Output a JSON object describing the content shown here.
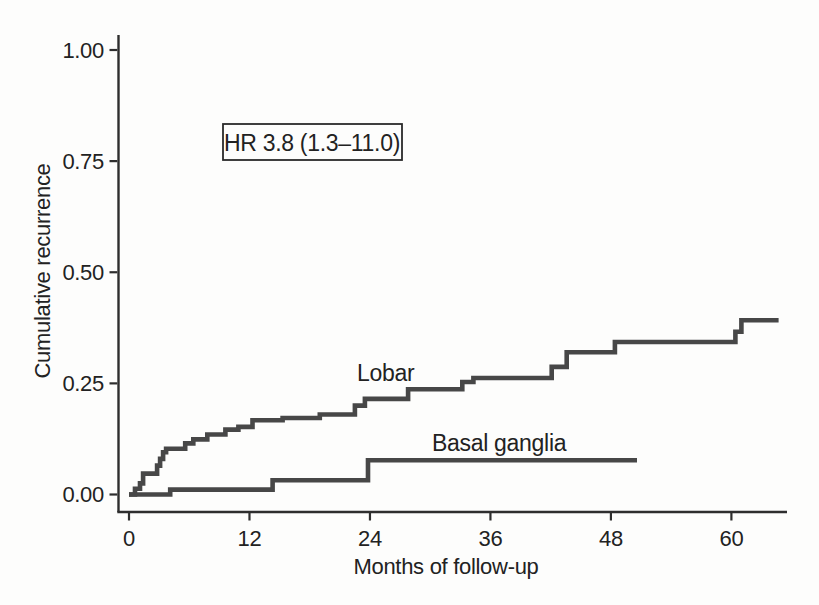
{
  "chart_data": {
    "type": "line",
    "subtype": "kaplan-meier-step",
    "title": "",
    "xlabel": "Months of follow-up",
    "ylabel": "Cumulative recurrence",
    "xlim": [
      0,
      65.5
    ],
    "ylim": [
      0,
      1.0
    ],
    "grid": false,
    "legend_position": "inline-labels",
    "line_color": "#474747",
    "x_ticks": {
      "values": [
        0,
        12,
        24,
        36,
        48,
        60
      ],
      "labels": [
        "0",
        "12",
        "24",
        "36",
        "48",
        "60"
      ]
    },
    "y_ticks": {
      "values": [
        0,
        0.25,
        0.5,
        0.75,
        1.0
      ],
      "labels": [
        "0.00",
        "0.25",
        "0.50",
        "0.75",
        "1.00"
      ]
    },
    "annotation": {
      "text": "HR 3.8 (1.3–11.0)"
    },
    "series": [
      {
        "name": "Lobar",
        "label": "Lobar",
        "end_x": 64.7,
        "points": [
          [
            0,
            0
          ],
          [
            0.6,
            0.013
          ],
          [
            1.1,
            0.025
          ],
          [
            1.4,
            0.047
          ],
          [
            2.8,
            0.065
          ],
          [
            3.1,
            0.08
          ],
          [
            3.4,
            0.095
          ],
          [
            3.7,
            0.103
          ],
          [
            5.6,
            0.115
          ],
          [
            6.4,
            0.124
          ],
          [
            7.8,
            0.135
          ],
          [
            9.6,
            0.146
          ],
          [
            10.9,
            0.152
          ],
          [
            12.3,
            0.167
          ],
          [
            15.3,
            0.172
          ],
          [
            19,
            0.18
          ],
          [
            22.5,
            0.2
          ],
          [
            23.5,
            0.215
          ],
          [
            27.8,
            0.237
          ],
          [
            33.2,
            0.253
          ],
          [
            34.3,
            0.262
          ],
          [
            42.1,
            0.287
          ],
          [
            43.6,
            0.32
          ],
          [
            48.4,
            0.343
          ],
          [
            60.4,
            0.366
          ],
          [
            61,
            0.392
          ]
        ]
      },
      {
        "name": "Basal ganglia",
        "label": "Basal ganglia",
        "end_x": 50.6,
        "points": [
          [
            0,
            0
          ],
          [
            4.1,
            0.011
          ],
          [
            14.3,
            0.032
          ],
          [
            23.8,
            0.077
          ]
        ]
      }
    ]
  }
}
